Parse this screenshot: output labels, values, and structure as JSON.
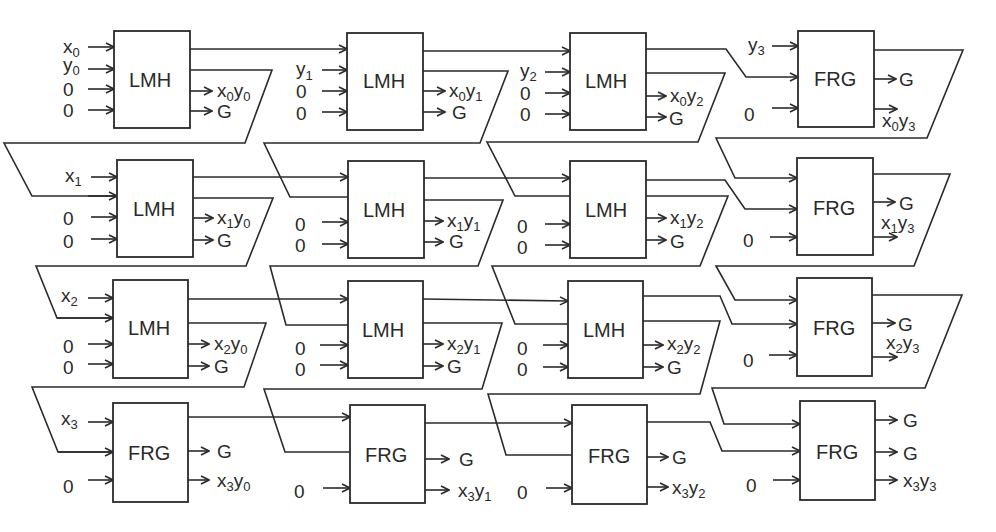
{
  "diagram": {
    "grid": [
      [
        {
          "type": "LMH",
          "inputs": [
            "x0",
            "y0",
            "0",
            "0"
          ],
          "outputs": [
            "x0y0",
            "G"
          ]
        },
        {
          "type": "LMH",
          "inputs": [
            "",
            "y1",
            "0",
            "0"
          ],
          "outputs": [
            "x0y1",
            "G"
          ]
        },
        {
          "type": "LMH",
          "inputs": [
            "",
            "y2",
            "0",
            "0"
          ],
          "outputs": [
            "x0y2",
            "G"
          ]
        },
        {
          "type": "FRG",
          "inputs": [
            "y3",
            "",
            "0"
          ],
          "outputs": [
            "G",
            "x0y3"
          ]
        }
      ],
      [
        {
          "type": "LMH",
          "inputs": [
            "x1",
            "",
            "0",
            "0"
          ],
          "outputs": [
            "x1y0",
            "G"
          ]
        },
        {
          "type": "LMH",
          "inputs": [
            "",
            "",
            "0",
            "0"
          ],
          "outputs": [
            "x1y1",
            "G"
          ]
        },
        {
          "type": "LMH",
          "inputs": [
            "",
            "",
            "0",
            "0"
          ],
          "outputs": [
            "x1y2",
            "G"
          ]
        },
        {
          "type": "FRG",
          "inputs": [
            "",
            "",
            "0"
          ],
          "outputs": [
            "G",
            "x1y3"
          ]
        }
      ],
      [
        {
          "type": "LMH",
          "inputs": [
            "x2",
            "",
            "0",
            "0"
          ],
          "outputs": [
            "x2y0",
            "G"
          ]
        },
        {
          "type": "LMH",
          "inputs": [
            "",
            "",
            "0",
            "0"
          ],
          "outputs": [
            "x2y1",
            "G"
          ]
        },
        {
          "type": "LMH",
          "inputs": [
            "",
            "",
            "0",
            "0"
          ],
          "outputs": [
            "x2y2",
            "G"
          ]
        },
        {
          "type": "FRG",
          "inputs": [
            "",
            "",
            "0"
          ],
          "outputs": [
            "G",
            "x2y3"
          ]
        }
      ],
      [
        {
          "type": "FRG",
          "inputs": [
            "x3",
            "",
            "0"
          ],
          "outputs": [
            "G",
            "x3y0"
          ]
        },
        {
          "type": "FRG",
          "inputs": [
            "",
            "",
            "0"
          ],
          "outputs": [
            "G",
            "x3y1"
          ]
        },
        {
          "type": "FRG",
          "inputs": [
            "",
            "",
            "0"
          ],
          "outputs": [
            "G",
            "x3y2"
          ]
        },
        {
          "type": "FRG",
          "inputs": [
            "",
            "",
            "0"
          ],
          "outputs": [
            "G",
            "G",
            "x3y3"
          ]
        }
      ]
    ]
  },
  "labels": {
    "lmh": "LMH",
    "frg": "FRG",
    "zero": "0",
    "g": "G",
    "x": "x",
    "y": "y",
    "d0": "0",
    "d1": "1",
    "d2": "2",
    "d3": "3"
  }
}
